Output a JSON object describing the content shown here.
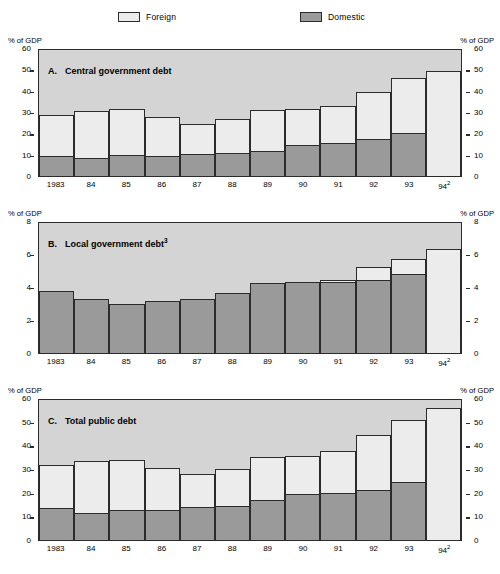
{
  "legend": {
    "items": [
      {
        "label": "Foreign",
        "color": "#ececec",
        "key": "foreign"
      },
      {
        "label": "Domestic",
        "color": "#9a9a9a",
        "key": "domestic"
      }
    ]
  },
  "axis_unit_label": "% of GDP",
  "chart_data": [
    {
      "type": "bar",
      "id": "panel-a",
      "title": "Central government debt",
      "panel_letter": "A.",
      "title_superscript": "",
      "stacked": true,
      "categories": [
        "1983",
        "84",
        "85",
        "86",
        "87",
        "88",
        "89",
        "90",
        "91",
        "92",
        "93",
        "94"
      ],
      "category_superscripts": [
        "",
        "",
        "",
        "",
        "",
        "",
        "",
        "",
        "",
        "",
        "",
        "2"
      ],
      "series": [
        {
          "name": "Domestic",
          "values": [
            9.7,
            8.6,
            10.0,
            9.7,
            10.7,
            10.8,
            12.0,
            15.0,
            15.5,
            17.5,
            20.5,
            0.0
          ]
        },
        {
          "name": "Foreign",
          "values": [
            19.3,
            22.4,
            22.0,
            18.3,
            14.3,
            16.2,
            19.5,
            17.0,
            18.0,
            22.5,
            26.0,
            50.0
          ]
        }
      ],
      "totals": [
        29.0,
        31.0,
        32.0,
        28.0,
        25.0,
        27.0,
        31.5,
        32.0,
        33.5,
        40.0,
        46.5,
        50.0
      ],
      "ylabel": "% of GDP",
      "xlabel": "",
      "ylim": [
        0,
        60
      ],
      "yticks": [
        0,
        10,
        20,
        30,
        40,
        50,
        60
      ],
      "grid": false,
      "legend_position": "top"
    },
    {
      "type": "bar",
      "id": "panel-b",
      "title": "Local government debt",
      "panel_letter": "B.",
      "title_superscript": "3",
      "stacked": true,
      "categories": [
        "1983",
        "84",
        "85",
        "86",
        "87",
        "88",
        "89",
        "90",
        "91",
        "92",
        "93",
        "94"
      ],
      "category_superscripts": [
        "",
        "",
        "",
        "",
        "",
        "",
        "",
        "",
        "",
        "",
        "",
        "2"
      ],
      "series": [
        {
          "name": "Domestic",
          "values": [
            3.8,
            3.3,
            3.0,
            3.2,
            3.35,
            3.7,
            4.3,
            4.4,
            4.4,
            4.5,
            4.85,
            0.0
          ]
        },
        {
          "name": "Foreign",
          "values": [
            0.0,
            0.0,
            0.0,
            0.0,
            0.0,
            0.0,
            0.0,
            0.0,
            0.1,
            0.8,
            0.95,
            6.4
          ]
        }
      ],
      "totals": [
        3.8,
        3.3,
        3.0,
        3.2,
        3.35,
        3.7,
        4.3,
        4.4,
        4.5,
        5.3,
        5.8,
        6.4
      ],
      "ylabel": "% of GDP",
      "xlabel": "",
      "ylim": [
        0,
        8
      ],
      "yticks": [
        0,
        2,
        4,
        6,
        8
      ],
      "grid": false,
      "legend_position": "top"
    },
    {
      "type": "bar",
      "id": "panel-c",
      "title": "Total public debt",
      "panel_letter": "C.",
      "title_superscript": "",
      "stacked": true,
      "categories": [
        "1983",
        "84",
        "85",
        "86",
        "87",
        "88",
        "89",
        "90",
        "91",
        "92",
        "93",
        "94"
      ],
      "category_superscripts": [
        "",
        "",
        "",
        "",
        "",
        "",
        "",
        "",
        "",
        "",
        "",
        "2"
      ],
      "series": [
        {
          "name": "Domestic",
          "values": [
            13.6,
            11.4,
            12.7,
            12.8,
            14.2,
            14.5,
            17.0,
            19.7,
            20.0,
            21.5,
            24.8,
            0.0
          ]
        },
        {
          "name": "Foreign",
          "values": [
            18.7,
            22.6,
            21.6,
            18.2,
            14.1,
            16.0,
            18.5,
            16.3,
            18.0,
            23.5,
            26.7,
            56.5
          ]
        }
      ],
      "totals": [
        32.3,
        34.0,
        34.3,
        31.0,
        28.3,
        30.5,
        35.5,
        36.0,
        38.0,
        45.0,
        51.5,
        56.5
      ],
      "ylabel": "% of GDP",
      "xlabel": "",
      "ylim": [
        0,
        60
      ],
      "yticks": [
        0,
        10,
        20,
        30,
        40,
        50,
        60
      ],
      "grid": false,
      "legend_position": "top"
    }
  ]
}
